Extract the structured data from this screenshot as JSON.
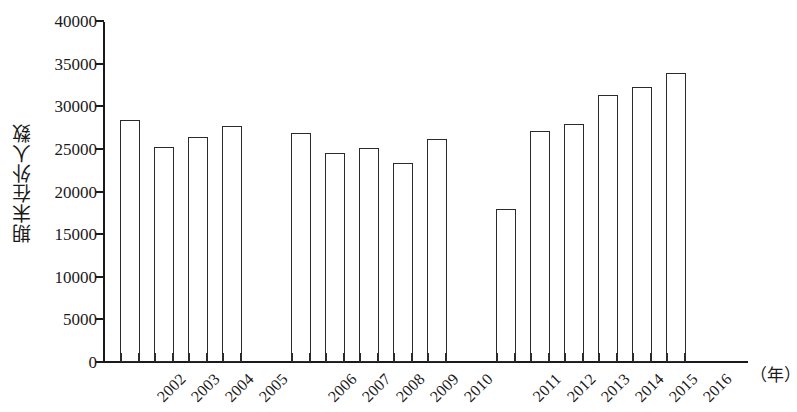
{
  "chart_data": {
    "type": "bar",
    "title": "",
    "subtitle": "",
    "xlabel": "（年）",
    "ylabel": "期末在外人数",
    "categories": [
      "2002",
      "2003",
      "2004",
      "2005",
      "2006",
      "2007",
      "2008",
      "2009",
      "2010",
      "2011",
      "2012",
      "2013",
      "2014",
      "2015",
      "2016"
    ],
    "values": [
      28400,
      25200,
      26400,
      27700,
      26900,
      24500,
      25100,
      23400,
      26200,
      17900,
      27100,
      27900,
      31300,
      32300,
      33900
    ],
    "ylim": [
      0,
      40000
    ],
    "y_tick_values": [
      0,
      5000,
      10000,
      15000,
      20000,
      25000,
      30000,
      35000,
      40000
    ],
    "y_tick_labels": [
      "0",
      "5000",
      "10000",
      "15000",
      "20000",
      "25000",
      "30000",
      "35000",
      "40000"
    ],
    "grid": false,
    "legend": null,
    "legend_position": "none",
    "bar_style": {
      "fill_color": "#ffffff",
      "edge_color": "#2b2b2b"
    },
    "axis_color": "#1a1a1a",
    "group_gaps_after": [
      "2005",
      "2010"
    ],
    "x_label_rotation_deg": -45
  }
}
